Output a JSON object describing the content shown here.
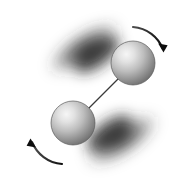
{
  "figure": {
    "description": "Two shaded spheres joined by a thin rigid rod, rotating about their common centre, with motion blur along the sweep path and two curved arrows showing the sense of rotation.",
    "background_color": "#ffffff",
    "canvas": {
      "width": 180,
      "height": 190
    }
  },
  "spheres": [
    {
      "name": "upper-right-sphere",
      "label": "atom-1",
      "cx": 133,
      "cy": 63,
      "r": 22,
      "highlight_cx": 124,
      "highlight_cy": 53,
      "highlight_color": "#f2f2f2",
      "midtone_color": "#b4b4b4",
      "rim_color": "#6a6a6a",
      "edge_color": "#5a5a5a"
    },
    {
      "name": "lower-left-sphere",
      "label": "atom-2",
      "cx": 73,
      "cy": 123,
      "r": 22,
      "highlight_cx": 64,
      "highlight_cy": 113,
      "highlight_color": "#f2f2f2",
      "midtone_color": "#b4b4b4",
      "rim_color": "#6a6a6a",
      "edge_color": "#5a5a5a"
    }
  ],
  "rod": {
    "name": "connecting-rod",
    "x1": 118,
    "y1": 79,
    "x2": 88,
    "y2": 109,
    "color": "#3a3a3a",
    "width": 1.2
  },
  "motion_blur": {
    "name": "rotation-motion-blur",
    "color": "#2b2b2b",
    "axis_angle_deg": -45,
    "center_x": 103,
    "center_y": 93,
    "lobes": [
      {
        "name": "upper-left-blur-lobe",
        "cx": 84,
        "cy": 48,
        "rx": 44,
        "ry": 17,
        "rotation": -33,
        "opacity": 0.85
      },
      {
        "name": "lower-right-blur-lobe",
        "cx": 122,
        "cy": 140,
        "rx": 44,
        "ry": 17,
        "rotation": -33,
        "opacity": 0.85
      }
    ],
    "blur_std_deviation": 7
  },
  "arrows": [
    {
      "name": "top-right-rotation-arrow",
      "direction": "clockwise-sweep-down-right",
      "path": "M 133 27 C 147 28, 159 38, 164 50",
      "head_x": 165,
      "head_y": 52,
      "head_angle_deg": 70,
      "color": "#141414",
      "stroke_start_width": 1.0,
      "stroke_end_width": 2.6
    },
    {
      "name": "bottom-left-rotation-arrow",
      "direction": "clockwise-sweep-up-left",
      "path": "M 61 164 C 47 162, 36 152, 31 139",
      "head_x": 30,
      "head_y": 137,
      "head_angle_deg": 250,
      "color": "#141414",
      "stroke_start_width": 1.0,
      "stroke_end_width": 2.6
    }
  ]
}
